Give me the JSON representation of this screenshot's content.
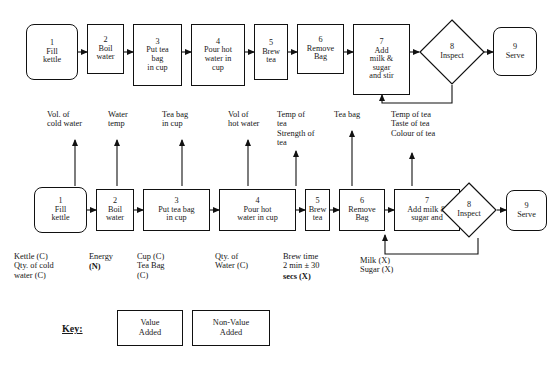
{
  "diagram": {
    "title_hidden": "",
    "top_process": {
      "name": "top-flow",
      "steps": [
        {
          "num": "1",
          "label": "Fill\nkettle",
          "shape": "rounded",
          "type": "value"
        },
        {
          "num": "2",
          "label": "Boil\nwater",
          "shape": "rect",
          "type": "value"
        },
        {
          "num": "3",
          "label": "Put tea\nbag\nin cup",
          "shape": "rect",
          "type": "value"
        },
        {
          "num": "4",
          "label": "Pour hot\nwater in\ncup",
          "shape": "rect",
          "type": "value"
        },
        {
          "num": "5",
          "label": "Brew\ntea",
          "shape": "rect",
          "type": "value"
        },
        {
          "num": "6",
          "label": "Remove\nBag",
          "shape": "rect",
          "type": "value"
        },
        {
          "num": "7",
          "label": "Add\nmilk &\nsugar\nand stir",
          "shape": "rect",
          "type": "value"
        },
        {
          "num": "8",
          "label": "Inspect",
          "shape": "diamond",
          "type": "non-value"
        },
        {
          "num": "9",
          "label": "Serve",
          "shape": "rounded",
          "type": "value"
        }
      ]
    },
    "bottom_process": {
      "name": "bottom-flow",
      "steps": [
        {
          "num": "1",
          "label": "Fill\nkettle",
          "shape": "rounded",
          "type": "value"
        },
        {
          "num": "2",
          "label": "Boil\nwater",
          "shape": "rect",
          "type": "value"
        },
        {
          "num": "3",
          "label": "Put tea bag\nin cup",
          "shape": "rect",
          "type": "value"
        },
        {
          "num": "4",
          "label": "Pour hot\nwater in cup",
          "shape": "rect",
          "type": "value"
        },
        {
          "num": "5",
          "label": "Brew\ntea",
          "shape": "rect",
          "type": "value"
        },
        {
          "num": "6",
          "label": "Remove\nBag",
          "shape": "rect",
          "type": "value"
        },
        {
          "num": "7",
          "label": "Add milk &\nsugar and",
          "shape": "rect",
          "type": "value"
        },
        {
          "num": "8",
          "label": "Inspect",
          "shape": "diamond",
          "type": "non-value"
        },
        {
          "num": "9",
          "label": "Serve",
          "shape": "rounded",
          "type": "value"
        }
      ]
    },
    "outputs": [
      {
        "id": "output-1",
        "text": "Vol. of\ncold water"
      },
      {
        "id": "output-2",
        "text": "Water\ntemp"
      },
      {
        "id": "output-3",
        "text": "Tea bag\nin cup"
      },
      {
        "id": "output-4",
        "text": "Vol of\nhot water"
      },
      {
        "id": "output-5",
        "text": "Temp of\ntea\nStrength of\ntea"
      },
      {
        "id": "output-6",
        "text": "Tea bag"
      },
      {
        "id": "output-7",
        "text": "Temp of tea\nTaste of tea\nColour of tea"
      }
    ],
    "inputs": [
      {
        "id": "input-1",
        "text": "Kettle (C)\nQty. of cold\nwater (C)",
        "emphasis": "normal"
      },
      {
        "id": "input-2",
        "text": "Energy",
        "emphasis": "normal"
      },
      {
        "id": "input-2b",
        "text": "(N)",
        "emphasis": "bold"
      },
      {
        "id": "input-3",
        "text": "Cup (C)\nTea Bag\n(C)",
        "emphasis": "normal"
      },
      {
        "id": "input-4",
        "text": "Qty. of\nWater (C)",
        "emphasis": "normal"
      },
      {
        "id": "input-5",
        "text": "Brew time\n2 min ± 30",
        "emphasis": "normal"
      },
      {
        "id": "input-5b",
        "text": "secs (X)",
        "emphasis": "bold"
      },
      {
        "id": "input-7",
        "text": "Milk (X)\nSugar (X)",
        "emphasis": "normal"
      }
    ],
    "key": {
      "label": "Key:",
      "items": [
        {
          "id": "key-value-added",
          "text": "Value\nAdded",
          "type": "value"
        },
        {
          "id": "key-non-value-added",
          "text": "Non-Value\nAdded",
          "type": "non-value"
        }
      ]
    },
    "colors": {
      "stroke": "#111111",
      "background": "#ffffff",
      "text": "#151515"
    }
  }
}
